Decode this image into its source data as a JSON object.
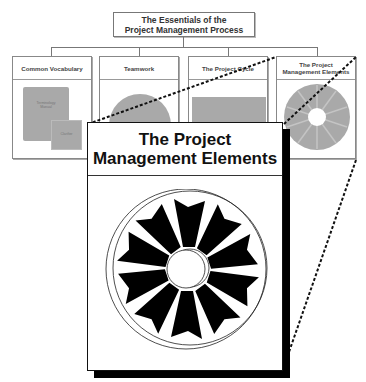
{
  "header": {
    "title_line1": "The Essentials of the",
    "title_line2": "Project Management Process"
  },
  "panels": [
    {
      "title": "Common Vocabulary",
      "illustration": "stacked-documents",
      "doc_labels": [
        "Terminology Manual",
        "Clarifier"
      ]
    },
    {
      "title": "Teamwork",
      "illustration": "gray-circle"
    },
    {
      "title": "The Project Cycle",
      "illustration": "gray-rectangle-with-wheels"
    },
    {
      "title_line1": "The Project",
      "title_line2": "Management Elements",
      "illustration": "gray-wheel"
    }
  ],
  "zoomed_panel": {
    "title_line1": "The Project",
    "title_line2": "Management Elements",
    "illustration": "ten-segment-wheel",
    "segment_count": 10
  },
  "colors": {
    "line": "#777777",
    "illustration_gray": "#a9a9a9",
    "segment_fill": "#000000",
    "shadow": "#000000"
  }
}
